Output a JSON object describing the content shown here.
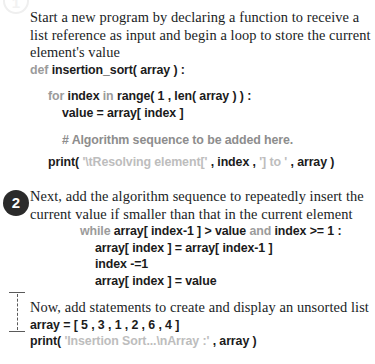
{
  "page": {
    "background": "#ffffff",
    "body_text_color": "#201d1e",
    "code_text_color": "#1b1b1b",
    "keyword_color": "#9b9b9b",
    "string_color": "#bdbdbd",
    "comment_color": "#8d8d8d",
    "marker_fill": "#2b2b2b",
    "marker_text_color": "#ffffff"
  },
  "markers": {
    "step1": "1",
    "step2": "2"
  },
  "steps": [
    {
      "id": "step-1",
      "prose": "Start a new program by declaring a function to receive a list reference as input and begin a loop to store the current element's value",
      "code": [
        {
          "indent": 0,
          "tokens": [
            {
              "type": "kw",
              "text": "def "
            },
            {
              "type": "code",
              "text": "insertion_sort( array ) :"
            }
          ]
        },
        {
          "type": "blank"
        },
        {
          "indent": 1,
          "tokens": [
            {
              "type": "kw",
              "text": "for "
            },
            {
              "type": "code",
              "text": "index "
            },
            {
              "type": "kw",
              "text": "in "
            },
            {
              "type": "code",
              "text": "range( 1 , len( array ) ) :"
            }
          ]
        },
        {
          "indent": 2,
          "tokens": [
            {
              "type": "code",
              "text": "value = array[ index ]"
            }
          ]
        },
        {
          "type": "blank"
        },
        {
          "indent": 2,
          "tokens": [
            {
              "type": "cmt",
              "text": "# Algorithm sequence to be added here."
            }
          ]
        },
        {
          "type": "blank-sm"
        },
        {
          "indent": 1,
          "tokens": [
            {
              "type": "code",
              "text": "print( "
            },
            {
              "type": "str",
              "text": "'\\tResolving element[' "
            },
            {
              "type": "code",
              "text": ", index , "
            },
            {
              "type": "str",
              "text": "'] to ' "
            },
            {
              "type": "code",
              "text": ", array )"
            }
          ]
        }
      ]
    },
    {
      "id": "step-2",
      "prose": "Next, add the algorithm sequence to repeatedly insert the current value if smaller than that in the current element",
      "code": [
        {
          "indent": 3,
          "tokens": [
            {
              "type": "kw",
              "text": "while "
            },
            {
              "type": "code",
              "text": "array[ index-1 ] > value "
            },
            {
              "type": "kw",
              "text": "and "
            },
            {
              "type": "code",
              "text": "index >= 1 :"
            }
          ]
        },
        {
          "indent": 4,
          "tokens": [
            {
              "type": "code",
              "text": "array[ index ] = array[ index-1 ]"
            }
          ]
        },
        {
          "indent": 4,
          "tokens": [
            {
              "type": "code",
              "text": "index -=1"
            }
          ]
        },
        {
          "indent": 4,
          "tokens": [
            {
              "type": "code",
              "text": "array[ index ] = value"
            }
          ]
        }
      ]
    },
    {
      "id": "step-3",
      "prose": "Now, add statements to create and display an unsorted list",
      "code": [
        {
          "indent": 0,
          "tokens": [
            {
              "type": "code",
              "text": "array = [ 5 , 3 , 1 , 2 , 6 , 4 ]"
            }
          ]
        },
        {
          "indent": 0,
          "tokens": [
            {
              "type": "code",
              "text": "print( "
            },
            {
              "type": "str",
              "text": "'Insertion Sort...\\nArray :' "
            },
            {
              "type": "code",
              "text": ", array )"
            }
          ]
        }
      ]
    }
  ]
}
